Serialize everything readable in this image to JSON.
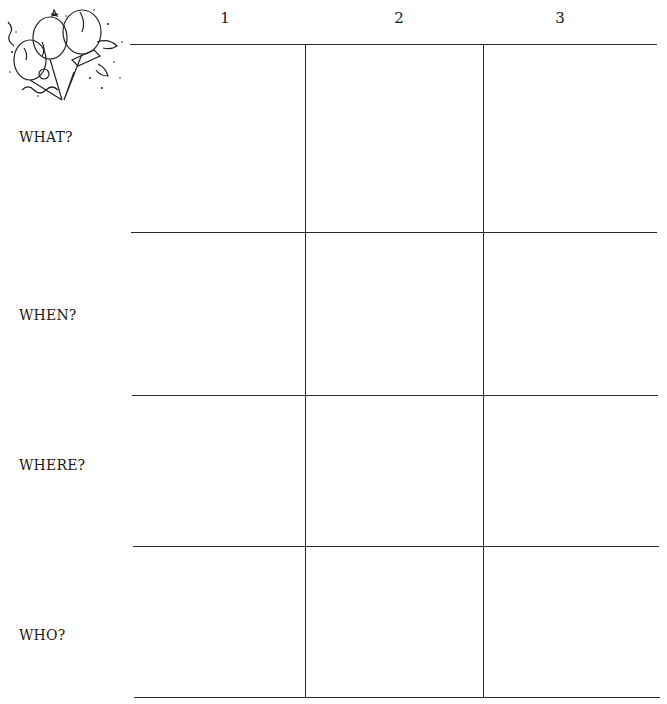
{
  "illustration": {
    "icon": "party-balloons-illustration"
  },
  "columns": [
    {
      "label": "1"
    },
    {
      "label": "2"
    },
    {
      "label": "3"
    }
  ],
  "rows": [
    {
      "label": "WHAT?"
    },
    {
      "label": "WHEN?"
    },
    {
      "label": "WHERE?"
    },
    {
      "label": "WHO?"
    }
  ],
  "cells": [
    [
      "",
      "",
      ""
    ],
    [
      "",
      "",
      ""
    ],
    [
      "",
      "",
      ""
    ],
    [
      "",
      "",
      ""
    ]
  ]
}
